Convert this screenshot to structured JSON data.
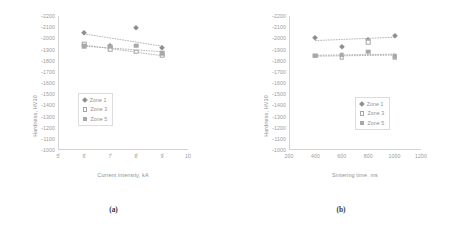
{
  "chart_data": [
    {
      "type": "scatter",
      "panel": "a",
      "caption": "(a)",
      "title": "",
      "xlabel": "Current intensity, kA",
      "ylabel": "Hardness, HV30",
      "xlim": [
        5,
        10
      ],
      "ylim": [
        1000,
        2200
      ],
      "xticks": [
        5,
        6,
        7,
        8,
        9,
        10
      ],
      "yticks": [
        1000,
        1100,
        1200,
        1300,
        1400,
        1500,
        1600,
        1700,
        1800,
        1900,
        2000,
        2100,
        2200
      ],
      "grid": false,
      "legend_position": "center-left",
      "x": [
        6,
        7,
        8,
        9
      ],
      "series": [
        {
          "name": "Zone 1",
          "marker": "filled-diamond",
          "values": [
            2045,
            1930,
            2090,
            1915
          ]
        },
        {
          "name": "Zone 3",
          "marker": "open-square",
          "values": [
            1945,
            1905,
            1880,
            1845
          ]
        },
        {
          "name": "Zone 5",
          "marker": "filled-square",
          "values": [
            1930,
            1925,
            1935,
            1865
          ]
        }
      ],
      "trendlines": [
        {
          "name": "Zone 1",
          "x0": 6,
          "y0": 2040,
          "x1": 9,
          "y1": 1930
        },
        {
          "name": "Zone 3",
          "x0": 6,
          "y0": 1940,
          "x1": 9,
          "y1": 1845
        },
        {
          "name": "Zone 5",
          "x0": 6,
          "y0": 1930,
          "x1": 9,
          "y1": 1880
        }
      ]
    },
    {
      "type": "scatter",
      "panel": "b",
      "caption": "(b)",
      "title": "",
      "xlabel": "Sintering time, ms",
      "ylabel": "Hardness, HV30",
      "xlim": [
        200,
        1200
      ],
      "ylim": [
        1000,
        2200
      ],
      "xticks": [
        200,
        400,
        600,
        800,
        1000,
        1200
      ],
      "yticks": [
        1000,
        1100,
        1200,
        1300,
        1400,
        1500,
        1600,
        1700,
        1800,
        1900,
        2000,
        2100,
        2200
      ],
      "grid": false,
      "legend_position": "center-right",
      "x": [
        400,
        600,
        800,
        1000
      ],
      "series": [
        {
          "name": "Zone 1",
          "marker": "filled-diamond",
          "values": [
            2005,
            1925,
            1985,
            2020
          ]
        },
        {
          "name": "Zone 3",
          "marker": "open-square",
          "values": [
            1845,
            1825,
            1965,
            1830
          ]
        },
        {
          "name": "Zone 5",
          "marker": "filled-square",
          "values": [
            1845,
            1855,
            1880,
            1840
          ]
        }
      ],
      "trendlines": [
        {
          "name": "Zone 1",
          "x0": 400,
          "y0": 1980,
          "x1": 1000,
          "y1": 2010
        },
        {
          "name": "Zone 3",
          "x0": 400,
          "y0": 1840,
          "x1": 1000,
          "y1": 1850
        },
        {
          "name": "Zone 5",
          "x0": 400,
          "y0": 1848,
          "x1": 1000,
          "y1": 1858
        }
      ]
    }
  ],
  "panel_a": {
    "caption": "(a)",
    "xlabel": "Current intensity, kA",
    "ylabel": "Hardness, HV30",
    "legend": [
      {
        "label": "Zone 1",
        "marker": "filled-diamond"
      },
      {
        "label": "Zone 3",
        "marker": "open-square"
      },
      {
        "label": "Zone 5",
        "marker": "filled-square"
      }
    ]
  },
  "panel_b": {
    "caption": "(b)",
    "xlabel": "Sintering time, ms",
    "ylabel": "Hardness, HV30",
    "legend": [
      {
        "label": "Zone 1",
        "marker": "filled-diamond"
      },
      {
        "label": "Zone 3",
        "marker": "open-square"
      },
      {
        "label": "Zone 5",
        "marker": "filled-square"
      }
    ]
  },
  "colors": {
    "axis": "#d3d3d3",
    "text": "#8f8f8f",
    "marker_dark": "#8e8e8e",
    "marker_light": "#a8a8a8",
    "background": "#ffffff"
  }
}
